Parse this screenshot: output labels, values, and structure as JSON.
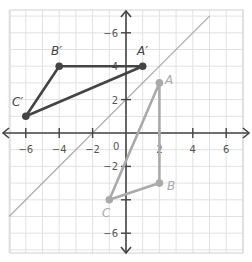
{
  "graph": {
    "x_range": [
      -7,
      7
    ],
    "y_range": [
      -7,
      7
    ],
    "origin_label": "0",
    "x_ticks": [
      {
        "value": -6,
        "label": "−6"
      },
      {
        "value": -4,
        "label": "−4"
      },
      {
        "value": -2,
        "label": "−2"
      },
      {
        "value": 2,
        "label": "2"
      },
      {
        "value": 4,
        "label": "4"
      },
      {
        "value": 6,
        "label": "6"
      }
    ],
    "y_ticks": [
      {
        "value": 6,
        "label": "−6"
      },
      {
        "value": 4,
        "label": "4"
      },
      {
        "value": 2,
        "label": "2"
      },
      {
        "value": -2,
        "label": "−2"
      },
      {
        "value": -4,
        "label": ""
      },
      {
        "value": -6,
        "label": "−6"
      }
    ],
    "colors": {
      "grid": "#e2e2e2",
      "axis": "#444444",
      "image_triangle": "#444444",
      "preimage_triangle": "#aaaaaa",
      "reflection_line": "#aaaaaa"
    }
  },
  "chart_data": {
    "type": "scatter",
    "title": "",
    "xlabel": "",
    "ylabel": "",
    "xlim": [
      -7,
      7
    ],
    "ylim": [
      -7,
      7
    ],
    "grid": true,
    "series": [
      {
        "name": "Triangle ABC (pre-image)",
        "points": [
          {
            "label": "A",
            "x": 2,
            "y": 3
          },
          {
            "label": "B",
            "x": 2,
            "y": -3
          },
          {
            "label": "C",
            "x": -1,
            "y": -4
          }
        ]
      },
      {
        "name": "Triangle A'B'C' (image)",
        "points": [
          {
            "label": "A′",
            "x": 1,
            "y": 4
          },
          {
            "label": "B′",
            "x": -4,
            "y": 4
          },
          {
            "label": "C′",
            "x": -6,
            "y": 1
          }
        ]
      },
      {
        "name": "Line of reflection",
        "equation": "y = x + 2",
        "points": [
          {
            "x": -7,
            "y": -5
          },
          {
            "x": 5,
            "y": 7
          }
        ]
      }
    ]
  },
  "labels": {
    "A": "A",
    "B": "B",
    "C": "C",
    "A_prime": "A′",
    "B_prime": "B′",
    "C_prime": "C′"
  }
}
